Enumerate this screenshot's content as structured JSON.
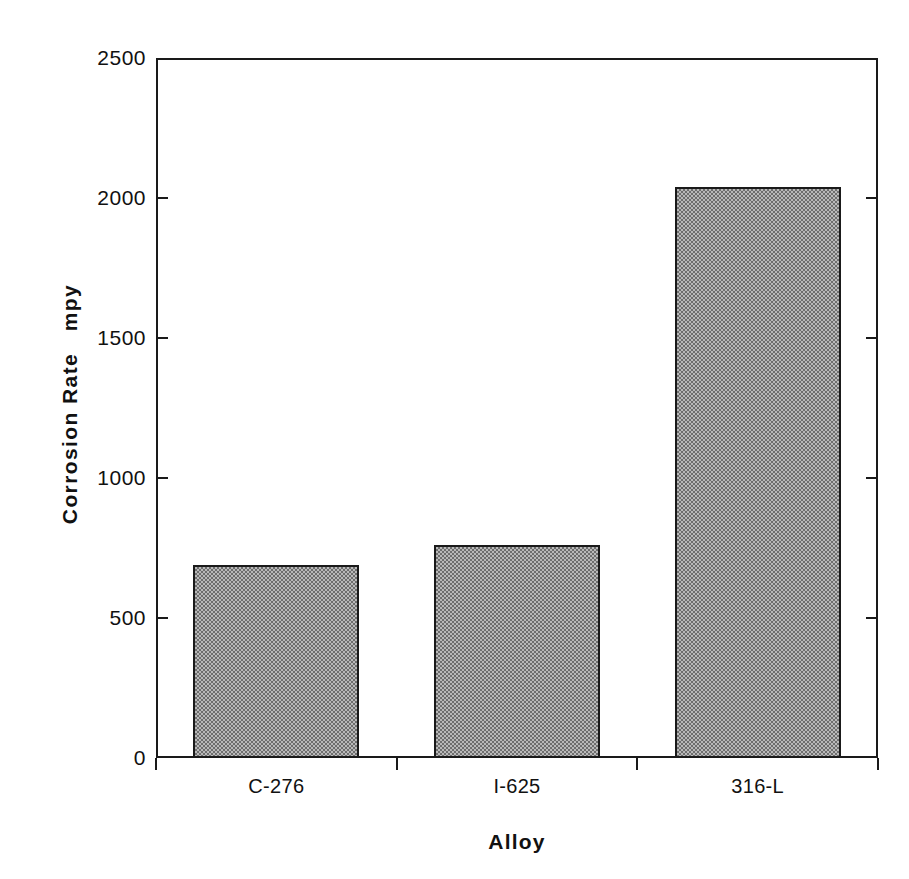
{
  "chart_data": {
    "type": "bar",
    "title": "",
    "xlabel": "Alloy",
    "ylabel": "Corrosion Rate   mpy",
    "categories": [
      "C-276",
      "I-625",
      "316-L"
    ],
    "values": [
      690,
      760,
      2040
    ],
    "series": [
      {
        "name": "Corrosion Rate",
        "values": [
          690,
          760,
          2040
        ]
      }
    ],
    "ylim": [
      0,
      2500
    ],
    "yticks": [
      0,
      500,
      1000,
      1500,
      2000,
      2500
    ],
    "ytick_labels": [
      "0",
      "500",
      "1000",
      "1500",
      "2000",
      "2500"
    ],
    "grid": false,
    "legend": "none",
    "bar_fill": "#9a9a9a",
    "bar_edge": "#1a1a1a",
    "axis_color": "#1a1a1a",
    "background": "#ffffff"
  }
}
